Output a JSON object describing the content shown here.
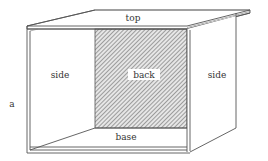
{
  "diagram": {
    "labels": {
      "top": "top",
      "side_left": "side",
      "back": "back",
      "side_right": "side",
      "base": "base",
      "marker": "a"
    },
    "colors": {
      "line": "#555555",
      "hatch": "#6a6a6a",
      "hatch_bg": "#e6e6e6",
      "label_box": "#ffffff",
      "text": "#333333"
    }
  }
}
